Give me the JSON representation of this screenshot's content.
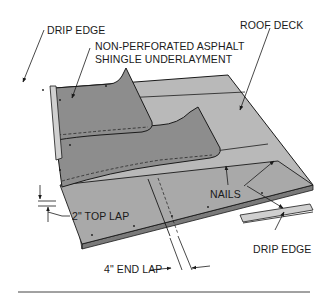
{
  "diagram": {
    "colors": {
      "deck": "#b9b9b9",
      "underlayment": "#8d8d8d",
      "deck_edge": "#7a7a7a",
      "drip_edge": "#cfcfcf",
      "line": "#1a1a1a"
    },
    "labels": {
      "drip_edge_top": "DRIP EDGE",
      "underlayment_line1": "NON-PERFORATED ASPHALT",
      "underlayment_line2": "SHINGLE UNDERLAYMENT",
      "roof_deck": "ROOF DECK",
      "nails": "NAILS",
      "top_lap": "2\" TOP LAP",
      "drip_edge_bottom": "DRIP EDGE",
      "end_lap": "4\" END LAP"
    }
  }
}
